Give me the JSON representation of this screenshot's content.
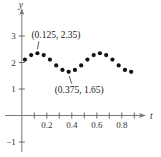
{
  "chart_data": {
    "type": "scatter",
    "title": "",
    "xlabel": "t",
    "ylabel": "y",
    "xlim": [
      -0.15,
      1.0
    ],
    "ylim": [
      -1.4,
      4.0
    ],
    "x_ticks": [
      0.1,
      0.2,
      0.3,
      0.4,
      0.5,
      0.6,
      0.7,
      0.8,
      0.9
    ],
    "x_tick_labels": [
      {
        "value": 0.2,
        "label": "0.2"
      },
      {
        "value": 0.4,
        "label": "0.4"
      },
      {
        "value": 0.6,
        "label": "0.6"
      },
      {
        "value": 0.8,
        "label": "0.8"
      }
    ],
    "y_tick_labels": [
      {
        "value": 3,
        "label": "3"
      },
      {
        "value": 2,
        "label": "2"
      },
      {
        "value": 1,
        "label": "1"
      },
      {
        "value": -1,
        "label": "−1"
      }
    ],
    "grid": false,
    "legend": "none",
    "series": [
      {
        "name": "data",
        "x": [
          0.025,
          0.075,
          0.125,
          0.175,
          0.225,
          0.275,
          0.325,
          0.375,
          0.425,
          0.475,
          0.525,
          0.575,
          0.625,
          0.675,
          0.725,
          0.775,
          0.825,
          0.875
        ],
        "y": [
          2.11,
          2.28,
          2.35,
          2.28,
          2.11,
          1.89,
          1.72,
          1.65,
          1.72,
          1.89,
          2.11,
          2.28,
          2.35,
          2.28,
          2.11,
          1.89,
          1.72,
          1.65
        ]
      }
    ],
    "annotations": [
      {
        "text": "(0.125, 2.35)",
        "x": 0.125,
        "y": 2.35,
        "position": "above"
      },
      {
        "text": "(0.375, 1.65)",
        "x": 0.375,
        "y": 1.65,
        "position": "below"
      }
    ]
  }
}
